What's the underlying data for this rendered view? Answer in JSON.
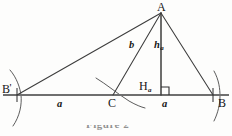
{
  "figure": {
    "type": "geometric-construction-diagram",
    "canvas": {
      "width": 232,
      "height": 136
    },
    "stroke_color": "#3c3c3c",
    "baseline_color": "#6b6b6b",
    "label_color": "#161616",
    "points": {
      "A": {
        "label": "A",
        "x": 161,
        "y": 13,
        "label_x": 157,
        "label_y": 1
      },
      "B_prime": {
        "label": "B",
        "prime": "'",
        "x": 17,
        "y": 95,
        "label_x": 2,
        "label_y": 83
      },
      "C": {
        "label": "C",
        "x": 113,
        "y": 95,
        "label_x": 108,
        "label_y": 97
      },
      "H_a": {
        "label": "H",
        "subscript": "a",
        "x": 161,
        "y": 95,
        "label_x": 139,
        "label_y": 80
      },
      "B": {
        "label": "B",
        "x": 213,
        "y": 95,
        "label_x": 218,
        "label_y": 97
      }
    },
    "segment_labels": {
      "b": {
        "label": "b",
        "x": 129,
        "y": 40
      },
      "h_a": {
        "label": "h",
        "subscript": "a",
        "x": 154,
        "y": 40
      },
      "a_left": {
        "label": "a",
        "x": 57,
        "y": 99
      },
      "a_right": {
        "label": "a",
        "x": 162,
        "y": 99
      }
    },
    "right_angle_marker": {
      "at": "H_a",
      "size": 8,
      "side": "right"
    },
    "arcs": [
      {
        "name": "arc-at-B-prime",
        "center_side": "left"
      },
      {
        "name": "arc-at-C",
        "center_side": "middle"
      },
      {
        "name": "arc-at-B",
        "center_side": "right"
      }
    ],
    "caption": {
      "text": "Figure 2",
      "clipped": true
    }
  }
}
